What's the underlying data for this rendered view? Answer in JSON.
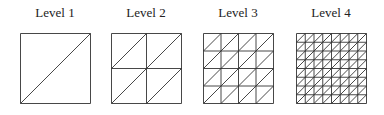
{
  "figure": {
    "panels": [
      {
        "label": "Level 1",
        "subdivisions": 1,
        "x": 20
      },
      {
        "label": "Level 2",
        "subdivisions": 2,
        "x": 111
      },
      {
        "label": "Level 3",
        "subdivisions": 4,
        "x": 203
      },
      {
        "label": "Level 4",
        "subdivisions": 8,
        "x": 296
      }
    ],
    "box_size": 70,
    "line_color": "#333333"
  }
}
